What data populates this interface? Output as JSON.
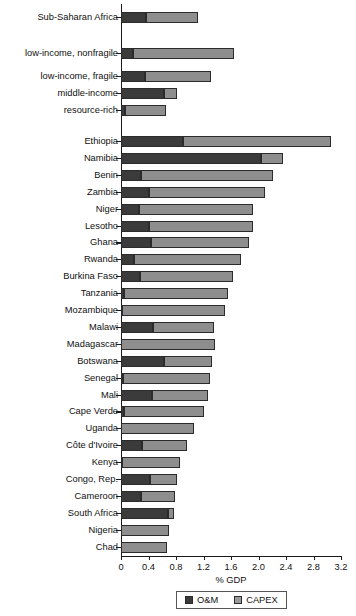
{
  "chart_data": {
    "type": "bar",
    "orientation": "horizontal",
    "stacked": true,
    "title": "",
    "subtitle": "",
    "xlabel": "% GDP",
    "ylabel": "",
    "xlim": [
      0,
      3.2
    ],
    "xticks": [
      "0",
      "0.4",
      "0.8",
      "1.2",
      "1.6",
      "2.0",
      "2.4",
      "2.8",
      "3.2"
    ],
    "xtick_values": [
      0,
      0.4,
      0.8,
      1.2,
      1.6,
      2.0,
      2.4,
      2.8,
      3.2
    ],
    "grid": false,
    "legend_position": "bottom",
    "legend": [
      "O&M",
      "CAPEX"
    ],
    "series": [
      {
        "name": "O&M",
        "color": "#3b3b3b"
      },
      {
        "name": "CAPEX",
        "color": "#8e8e8e"
      }
    ],
    "groups": [
      {
        "name": "aggregates",
        "categories": [
          "Sub-Saharan Africa",
          "low-income, nonfragile",
          "low-income, fragile",
          "middle-income",
          "resource-rich"
        ],
        "om": [
          0.36,
          0.17,
          0.35,
          0.63,
          0.06
        ],
        "capex": [
          0.76,
          1.47,
          0.96,
          0.18,
          0.6
        ],
        "total": [
          1.12,
          1.64,
          1.31,
          0.81,
          0.66
        ]
      },
      {
        "name": "countries",
        "categories": [
          "Ethiopia",
          "Namibia",
          "Benin",
          "Zambia",
          "Niger",
          "Lesotho",
          "Ghana",
          "Rwanda",
          "Burkina Faso",
          "Tanzania",
          "Mozambique",
          "Malawi",
          "Madagascar",
          "Botswana",
          "Senegal",
          "Mali",
          "Cape Verde",
          "Uganda",
          "Côte d'Ivoire",
          "Kenya",
          "Congo, Rep.",
          "Cameroon",
          "South Africa",
          "Nigeria",
          "Chad"
        ],
        "om": [
          0.9,
          2.04,
          0.29,
          0.41,
          0.26,
          0.41,
          0.44,
          0.19,
          0.28,
          0.04,
          0.02,
          0.47,
          0.0,
          0.63,
          0.03,
          0.45,
          0.05,
          0.0,
          0.31,
          0.02,
          0.42,
          0.29,
          0.69,
          0.0,
          0.0
        ],
        "capex": [
          2.15,
          0.32,
          1.92,
          1.68,
          1.66,
          1.51,
          1.42,
          1.56,
          1.35,
          1.52,
          1.49,
          0.88,
          1.37,
          0.69,
          1.26,
          0.82,
          1.16,
          1.06,
          0.65,
          0.84,
          0.39,
          0.5,
          0.08,
          0.7,
          0.67
        ],
        "total": [
          3.05,
          2.36,
          2.21,
          2.09,
          1.92,
          1.92,
          1.86,
          1.75,
          1.63,
          1.56,
          1.51,
          1.35,
          1.37,
          1.32,
          1.29,
          1.27,
          1.21,
          1.06,
          0.96,
          0.86,
          0.81,
          0.79,
          0.77,
          0.7,
          0.67
        ]
      }
    ]
  },
  "axis": {
    "x_title": "% GDP"
  },
  "legend": {
    "om_label": "O&M",
    "capex_label": "CAPEX"
  }
}
